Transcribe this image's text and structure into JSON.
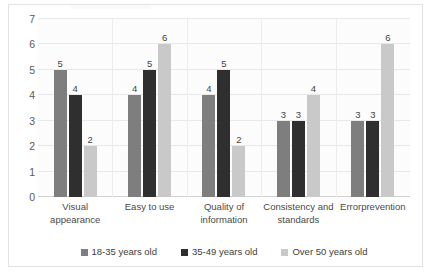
{
  "chart_data": {
    "type": "bar",
    "title": "",
    "subtitle": "",
    "xlabel": "",
    "ylabel": "",
    "ylim": [
      0,
      7
    ],
    "ytick_labels": [
      "7",
      "6",
      "5",
      "4",
      "3",
      "2",
      "1",
      "0"
    ],
    "ytick_values": [
      7,
      6,
      5,
      4,
      3,
      2,
      1,
      0
    ],
    "grid": true,
    "legend_position": "bottom",
    "categories": [
      "Visual appearance",
      "Easy to use",
      "Quality of information",
      "Consistency and standards",
      "Errorprevention"
    ],
    "category_lines": [
      [
        "Visual",
        "appearance"
      ],
      [
        "Easy to use",
        ""
      ],
      [
        "Quality of",
        "information"
      ],
      [
        "Consistency and",
        "standards"
      ],
      [
        "Errorprevention",
        ""
      ]
    ],
    "series": [
      {
        "name": "18-35 years old",
        "color": "#7e7e7e",
        "values": [
          5,
          4,
          4,
          3,
          3
        ]
      },
      {
        "name": "35-49 years old",
        "color": "#2f2f2f",
        "values": [
          4,
          5,
          5,
          3,
          3
        ]
      },
      {
        "name": "Over 50 years old",
        "color": "#c9c9c9",
        "values": [
          2,
          6,
          2,
          4,
          6
        ]
      }
    ],
    "data_labels_shown": true
  },
  "legend": {
    "items": [
      {
        "label": "18-35 years old",
        "color": "#7e7e7e"
      },
      {
        "label": "35-49 years old",
        "color": "#2f2f2f"
      },
      {
        "label": "Over 50 years old",
        "color": "#c9c9c9"
      }
    ]
  }
}
